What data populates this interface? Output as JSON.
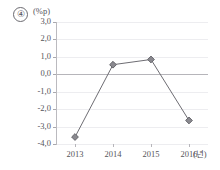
{
  "figure": {
    "item_number": "④",
    "y_unit_label": "(%p)",
    "x_unit_label": "(년)"
  },
  "chart_data": {
    "type": "line",
    "title": "",
    "subtitle": "",
    "xlabel": "(년)",
    "ylabel": "(%p)",
    "categories": [
      "2013",
      "2014",
      "2015",
      "2016"
    ],
    "values": [
      -3.6,
      0.55,
      0.85,
      -2.65
    ],
    "series": [
      {
        "name": "",
        "values": [
          -3.6,
          0.55,
          0.85,
          -2.65
        ]
      }
    ],
    "ylim": [
      -4.0,
      3.0
    ],
    "ytick_labels": [
      "3,0",
      "2,0",
      "1,0",
      "0,0",
      "-1,0",
      "-2,0",
      "-3,0",
      "-4,0"
    ],
    "ytick_values": [
      3.0,
      2.0,
      1.0,
      0.0,
      -1.0,
      -2.0,
      -3.0,
      -4.0
    ],
    "xtick_labels": [
      "2013",
      "2014",
      "2015",
      "2016"
    ],
    "grid": true,
    "grid_orientation": "horizontal",
    "zero_line": true,
    "legend": false,
    "legend_position": "none",
    "marker": "diamond",
    "colors": {
      "line": "#6e6d73",
      "marker_fill": "#8a898f",
      "marker_edge": "#5e5d63",
      "grid": "#ededf0",
      "zero_line": "#b6b5ba",
      "axis": "#bbbabf",
      "text": "#55545a",
      "background": "#ffffff"
    }
  }
}
